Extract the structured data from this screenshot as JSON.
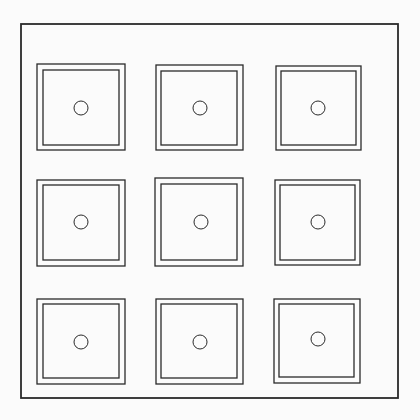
{
  "canvas": {
    "width": 420,
    "height": 420,
    "background": "#fbfbfb",
    "stroke": "#2a2a2a"
  },
  "frame": {
    "x": 21,
    "y": 24,
    "width": 377,
    "height": 374,
    "stroke_width": 1.8
  },
  "grid": {
    "rows": 3,
    "cols": 3,
    "tiles": [
      {
        "id": "r1c1",
        "outer": [
          37,
          64,
          88,
          86
        ],
        "inner": [
          43,
          70,
          76,
          75
        ],
        "circle": [
          81,
          108,
          7
        ]
      },
      {
        "id": "r1c2",
        "outer": [
          156,
          65,
          87,
          85
        ],
        "inner": [
          161,
          71,
          76,
          74
        ],
        "circle": [
          200,
          108,
          7
        ]
      },
      {
        "id": "r1c3",
        "outer": [
          276,
          66,
          85,
          84
        ],
        "inner": [
          281,
          71,
          75,
          74
        ],
        "circle": [
          318,
          108,
          7
        ]
      },
      {
        "id": "r2c1",
        "outer": [
          37,
          180,
          88,
          86
        ],
        "inner": [
          43,
          185,
          76,
          75
        ],
        "circle": [
          81,
          222,
          7
        ]
      },
      {
        "id": "r2c2",
        "outer": [
          155,
          178,
          88,
          88
        ],
        "inner": [
          161,
          184,
          76,
          76
        ],
        "circle": [
          201,
          222,
          7
        ]
      },
      {
        "id": "r2c3",
        "outer": [
          275,
          180,
          85,
          85
        ],
        "inner": [
          280,
          185,
          75,
          75
        ],
        "circle": [
          318,
          222,
          7
        ]
      },
      {
        "id": "r3c1",
        "outer": [
          37,
          299,
          88,
          85
        ],
        "inner": [
          43,
          304,
          76,
          74
        ],
        "circle": [
          81,
          342,
          7
        ]
      },
      {
        "id": "r3c2",
        "outer": [
          156,
          299,
          87,
          85
        ],
        "inner": [
          161,
          304,
          76,
          74
        ],
        "circle": [
          200,
          342,
          7
        ]
      },
      {
        "id": "r3c3",
        "outer": [
          274,
          299,
          86,
          84
        ],
        "inner": [
          279,
          304,
          75,
          73
        ],
        "circle": [
          318,
          339,
          7
        ]
      }
    ]
  }
}
